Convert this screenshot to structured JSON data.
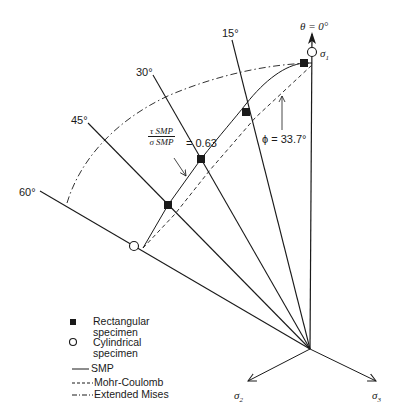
{
  "diagram": {
    "type": "pi-plane failure criteria comparison",
    "axes": {
      "theta_label": "θ = 0°",
      "sigma1": "σ",
      "sigma1_sub": "1",
      "sigma2": "σ",
      "sigma2_sub": "2",
      "sigma3": "σ",
      "sigma3_sub": "3"
    },
    "radial_lines": [
      {
        "label": "15°",
        "angle": 15
      },
      {
        "label": "30°",
        "angle": 30
      },
      {
        "label": "45°",
        "angle": 45
      },
      {
        "label": "60°",
        "angle": 60
      }
    ],
    "annotations": {
      "ratio_num": "τ SMP",
      "ratio_den": "σ SMP",
      "ratio_value": "= 0.63",
      "phi": "ϕ = 33.7°"
    },
    "data_points": {
      "rectangular": [
        {
          "theta": 0
        },
        {
          "theta": 15
        },
        {
          "theta": 30
        },
        {
          "theta": 45
        }
      ],
      "cylindrical": [
        {
          "theta": 0
        },
        {
          "theta": 60
        }
      ]
    },
    "legend": {
      "rect_line1": "Rectangular",
      "rect_line2": "specimen",
      "cyl_line1": "Cylindrical",
      "cyl_line2": "specimen",
      "smp": "SMP",
      "mohr": "Mohr-Coulomb",
      "mises": "Extended Mises"
    },
    "colors": {
      "ink": "#1a1a1a",
      "background": "#ffffff"
    }
  }
}
